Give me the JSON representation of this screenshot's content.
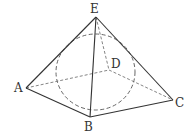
{
  "diagram": {
    "type": "geometry",
    "vertices": {
      "E": {
        "label": "E",
        "x": 96,
        "y": 17
      },
      "A": {
        "label": "A",
        "x": 26,
        "y": 88
      },
      "B": {
        "label": "B",
        "x": 90,
        "y": 117
      },
      "C": {
        "label": "C",
        "x": 173,
        "y": 100
      },
      "D": {
        "label": "D",
        "x": 109,
        "y": 70
      }
    },
    "solid_edges": [
      "EA",
      "EB",
      "EC",
      "AB",
      "BC"
    ],
    "dashed_edges": [
      "ED",
      "AD",
      "DC"
    ],
    "inscribed_sphere": {
      "cx": 95.5,
      "cy": 72,
      "rx": 39.5,
      "ry": 38,
      "style": "dashed"
    },
    "colors": {
      "line": "#333333",
      "dashed": "#666666",
      "background": "#ffffff"
    }
  }
}
